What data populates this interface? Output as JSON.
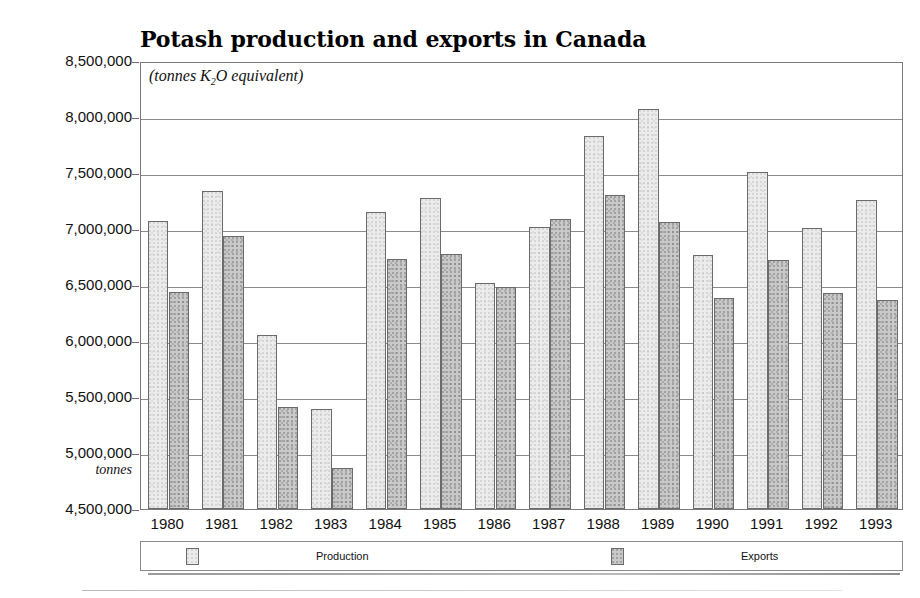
{
  "chart_data": {
    "type": "bar",
    "title": "Potash production and exports in Canada",
    "subtitle_prefix": "(tonnes K",
    "subtitle_sub": "2",
    "subtitle_suffix": "O equivalent)",
    "xlabel": "",
    "ylabel": "tonnes",
    "ylim": [
      4500000,
      8500000
    ],
    "ytick_step": 500000,
    "grid": true,
    "legend_position": "bottom",
    "categories": [
      "1980",
      "1981",
      "1982",
      "1983",
      "1984",
      "1985",
      "1986",
      "1987",
      "1988",
      "1989",
      "1990",
      "1991",
      "1992",
      "1993"
    ],
    "ytick_labels": [
      "8,500,000",
      "8,000,000",
      "7,500,000",
      "7,000,000",
      "6,500,000",
      "6,000,000",
      "5,500,000",
      "5,000,000",
      "4,500,000"
    ],
    "ytick_values": [
      8500000,
      8000000,
      7500000,
      7000000,
      6500000,
      6000000,
      5500000,
      5000000,
      4500000
    ],
    "series": [
      {
        "name": "Production",
        "color": "#ececec",
        "values": [
          7070000,
          7340000,
          6050000,
          5390000,
          7150000,
          7280000,
          6520000,
          7020000,
          7830000,
          8070000,
          6770000,
          7510000,
          7010000,
          7260000
        ]
      },
      {
        "name": "Exports",
        "color": "#c9c9c9",
        "values": [
          6440000,
          6940000,
          5410000,
          4870000,
          6730000,
          6780000,
          6480000,
          7090000,
          7300000,
          7060000,
          6380000,
          6720000,
          6430000,
          6370000
        ]
      }
    ]
  },
  "legend": {
    "entries": [
      {
        "label": "Production",
        "key": "production"
      },
      {
        "label": "Exports",
        "key": "exports"
      }
    ]
  }
}
